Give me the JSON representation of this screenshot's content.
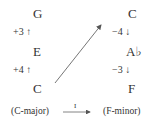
{
  "left_column": {
    "notes": [
      "G",
      "E",
      "C"
    ],
    "intervals": [
      "+3 ↑",
      "+4 ↑"
    ]
  },
  "right_column": {
    "notes": [
      "C",
      "A♭",
      "F"
    ],
    "intervals": [
      "−4 ↓",
      "−3 ↓"
    ]
  },
  "bottom": {
    "source_key": "(C-major)",
    "target_key": "(F-minor)",
    "transform_label": "I"
  },
  "colors": {
    "text": "#333333",
    "arrow": "#555555"
  }
}
